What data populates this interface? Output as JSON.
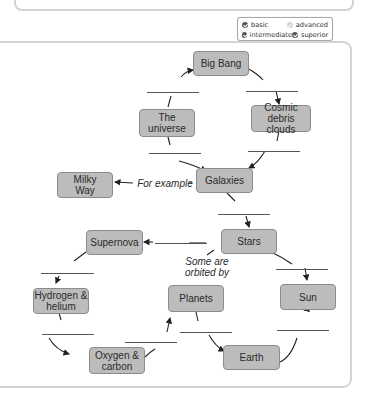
{
  "legend": {
    "items": [
      {
        "label": "basic",
        "state": "filled"
      },
      {
        "label": "advanced",
        "state": "empty"
      },
      {
        "label": "intermediate",
        "state": "filled"
      },
      {
        "label": "superior",
        "state": "filled"
      }
    ]
  },
  "diagram": {
    "nodes": {
      "big_bang": "Big Bang",
      "universe": "The\nuniverse",
      "cosmic_debris": "Cosmic debris\nclouds",
      "galaxies": "Galaxies",
      "milky_way": "Milky\nWay",
      "stars": "Stars",
      "supernova": "Supernova",
      "hydrogen_helium": "Hydrogen &\nhelium",
      "planets": "Planets",
      "sun": "Sun",
      "oxygen_carbon": "Oxygen &\ncarbon",
      "earth": "Earth"
    },
    "labels": {
      "for_example": "For example",
      "some_orbited": "Some are\norbited by"
    },
    "blank_count": 12
  }
}
